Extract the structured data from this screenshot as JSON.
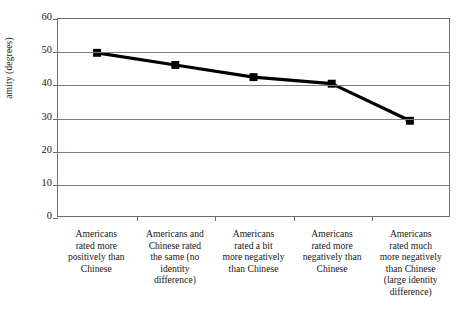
{
  "chart_data": {
    "type": "line",
    "title": "",
    "xlabel": "",
    "ylabel": "amity (degrees)",
    "ylim": [
      0,
      60
    ],
    "yticks": [
      0,
      10,
      20,
      30,
      40,
      50,
      60
    ],
    "grid": true,
    "legend": "none",
    "marker": "square",
    "line_color": "#000000",
    "marker_color": "#000000",
    "grid_color": "#7d7d7d",
    "background": "#ffffff",
    "categories": [
      "Americans rated more positively than Chinese",
      "Americans and Chinese rated the same (no identity difference)",
      "Americans rated a bit more negatively than Chinese",
      "Americans rated more negatively than Chinese",
      "Americans rated much more negatively than Chinese (large identity difference)"
    ],
    "category_lines": [
      [
        "Americans",
        "rated more",
        "positively than",
        "Chinese"
      ],
      [
        "Americans and",
        "Chinese rated",
        "the same (no",
        "identity",
        "difference)"
      ],
      [
        "Americans",
        "rated a bit",
        "more negatively",
        "than Chinese"
      ],
      [
        "Americans",
        "rated more",
        "negatively than",
        "Chinese"
      ],
      [
        "Americans",
        "rated much",
        "more negatively",
        "than Chinese",
        "(large identity",
        "difference)"
      ]
    ],
    "values": [
      49.7,
      46.0,
      42.3,
      40.3,
      29.0
    ]
  }
}
